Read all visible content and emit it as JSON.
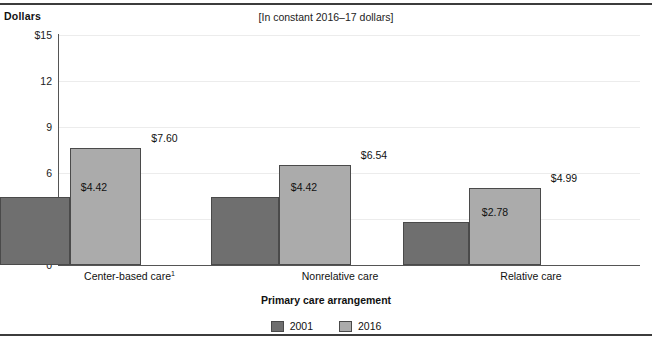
{
  "figure": {
    "y_axis_label": "Dollars",
    "subtitle": "[In constant 2016–17 dollars]",
    "ghost_title": ""
  },
  "chart_data": {
    "type": "bar",
    "title": "",
    "subtitle": "[In constant 2016–17 dollars]",
    "xlabel": "Primary care arrangement",
    "ylabel": "Dollars",
    "ylim": [
      0,
      15
    ],
    "yticks": [
      "$15",
      "12",
      "9",
      "6",
      "3",
      "0"
    ],
    "ytick_values": [
      15,
      12,
      9,
      6,
      3,
      0
    ],
    "grid": true,
    "legend_position": "bottom",
    "categories": [
      "Center-based care",
      "Nonrelative care",
      "Relative care"
    ],
    "category_labels": [
      "Center-based care¹",
      "Nonrelative care",
      "Relative care"
    ],
    "category_footnote_markers": [
      "1",
      "",
      ""
    ],
    "series": [
      {
        "name": "2001",
        "color": "#6f6f6f",
        "values": [
          4.42,
          6.54,
          2.78
        ],
        "value_labels": [
          "$4.42",
          "$4.42",
          "$2.78"
        ]
      },
      {
        "name": "2016",
        "color": "#ababab",
        "values": [
          7.6,
          6.54,
          4.99
        ],
        "value_labels": [
          "$7.60",
          "$6.54",
          "$4.99"
        ]
      }
    ],
    "bars": [
      {
        "category": "Center-based care",
        "series": "2001",
        "value": 4.42,
        "label": "$4.42"
      },
      {
        "category": "Center-based care",
        "series": "2016",
        "value": 7.6,
        "label": "$7.60"
      },
      {
        "category": "Nonrelative care",
        "series": "2001",
        "value": 4.42,
        "label": "$4.42"
      },
      {
        "category": "Nonrelative care",
        "series": "2016",
        "value": 6.54,
        "label": "$6.54"
      },
      {
        "category": "Relative care",
        "series": "2001",
        "value": 2.78,
        "label": "$2.78"
      },
      {
        "category": "Relative care",
        "series": "2016",
        "value": 4.99,
        "label": "$4.99"
      }
    ]
  },
  "legend": {
    "items": [
      {
        "label": "2001",
        "color": "#6f6f6f"
      },
      {
        "label": "2016",
        "color": "#ababab"
      }
    ]
  },
  "ytick_labels": {
    "t0": "$15",
    "t1": "12",
    "t2": "9",
    "t3": "6",
    "t4": "3",
    "t5": "0"
  },
  "bar_values": {
    "g1_2001": "$4.42",
    "g1_2016": "$7.60",
    "g2_2001": "$4.42",
    "g2_2016": "$6.54",
    "g3_2001": "$2.78",
    "g3_2016": "$4.99"
  },
  "group_labels": {
    "g1": "Center-based care",
    "g1_sup": "1",
    "g2": "Nonrelative care",
    "g3": "Relative care"
  },
  "axis_title": "Primary care arrangement"
}
